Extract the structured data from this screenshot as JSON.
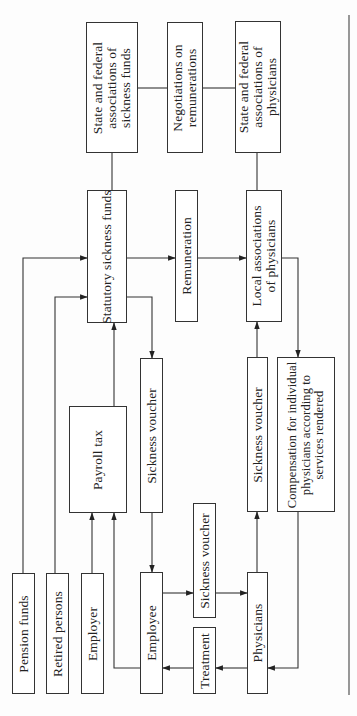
{
  "diagram": {
    "orientation": "rotated-90-ccw",
    "nodes": [
      {
        "id": "state_fed_sickness_funds",
        "label": "State and federal\nassociations of\nsickness funds",
        "rect": [
          86,
          22,
          138,
          153
        ]
      },
      {
        "id": "negotiations",
        "label": "Negotiations on\nremunerations",
        "rect": [
          167,
          22,
          203,
          153
        ]
      },
      {
        "id": "state_fed_physicians",
        "label": "State and federal\nassociations of\nphysicians",
        "rect": [
          235,
          21,
          281,
          153
        ]
      },
      {
        "id": "statutory_sickness_funds",
        "label": "Statutory sickness funds",
        "rect": [
          87,
          190,
          127,
          323
        ]
      },
      {
        "id": "remuneration",
        "label": "Remuneration",
        "rect": [
          175,
          190,
          198,
          322
        ]
      },
      {
        "id": "local_assoc_physicians",
        "label": "Local associations\nof physicians",
        "rect": [
          246,
          190,
          282,
          322
        ]
      },
      {
        "id": "payroll_tax",
        "label": "Payroll tax",
        "rect": [
          69,
          406,
          127,
          513
        ]
      },
      {
        "id": "sickness_voucher_1",
        "label": "Sickness voucher",
        "rect": [
          140,
          358,
          163,
          513
        ]
      },
      {
        "id": "sickness_voucher_3",
        "label": "Sickness voucher",
        "rect": [
          247,
          357,
          268,
          512
        ]
      },
      {
        "id": "compensation",
        "label": "Compensation for individual\nphysicians according to\nservices rendered",
        "rect": [
          277,
          357,
          335,
          512
        ]
      },
      {
        "id": "sickness_voucher_2",
        "label": "Sickness voucher",
        "rect": [
          193,
          503,
          216,
          618
        ]
      },
      {
        "id": "pension_funds",
        "label": "Pension funds",
        "rect": [
          12,
          573,
          35,
          694
        ]
      },
      {
        "id": "retired_persons",
        "label": "Retired persons",
        "rect": [
          46,
          573,
          69,
          694
        ]
      },
      {
        "id": "employer",
        "label": "Employer",
        "rect": [
          81,
          573,
          104,
          694
        ]
      },
      {
        "id": "employee",
        "label": "Employee",
        "rect": [
          140,
          572,
          163,
          694
        ]
      },
      {
        "id": "treatment",
        "label": "Treatment",
        "rect": [
          193,
          627,
          216,
          694
        ]
      },
      {
        "id": "physicians",
        "label": "Physicians",
        "rect": [
          247,
          572,
          268,
          694
        ]
      }
    ],
    "edges": [
      {
        "from": "state_fed_sickness_funds",
        "to": "statutory_sickness_funds",
        "arrow": false,
        "points": [
          [
            112,
            153
          ],
          [
            112,
            190
          ]
        ]
      },
      {
        "from": "state_fed_sickness_funds",
        "to": "negotiations",
        "arrow": false,
        "points": [
          [
            138,
            88
          ],
          [
            167,
            88
          ]
        ]
      },
      {
        "from": "negotiations",
        "to": "state_fed_physicians",
        "arrow": false,
        "points": [
          [
            203,
            88
          ],
          [
            235,
            88
          ]
        ]
      },
      {
        "from": "state_fed_physicians",
        "to": "local_assoc_physicians",
        "arrow": false,
        "points": [
          [
            257,
            153
          ],
          [
            257,
            190
          ]
        ]
      },
      {
        "from": "pension_funds",
        "to": "statutory_sickness_funds",
        "arrow": true,
        "points": [
          [
            23,
            573
          ],
          [
            23,
            258
          ],
          [
            87,
            258
          ]
        ]
      },
      {
        "from": "retired_persons",
        "to": "statutory_sickness_funds",
        "arrow": true,
        "points": [
          [
            55,
            573
          ],
          [
            55,
            297
          ],
          [
            87,
            297
          ]
        ]
      },
      {
        "from": "statutory_sickness_funds",
        "to": "remuneration",
        "arrow": true,
        "points": [
          [
            127,
            258
          ],
          [
            175,
            258
          ]
        ]
      },
      {
        "from": "remuneration",
        "to": "local_assoc_physicians",
        "arrow": true,
        "points": [
          [
            198,
            258
          ],
          [
            246,
            258
          ]
        ]
      },
      {
        "from": "statutory_sickness_funds",
        "to": "sickness_voucher_1",
        "arrow": true,
        "points": [
          [
            127,
            297
          ],
          [
            152,
            297
          ],
          [
            152,
            358
          ]
        ]
      },
      {
        "from": "payroll_tax",
        "to": "statutory_sickness_funds",
        "arrow": true,
        "points": [
          [
            114,
            406
          ],
          [
            114,
            323
          ]
        ]
      },
      {
        "from": "employer",
        "to": "payroll_tax",
        "arrow": true,
        "points": [
          [
            92,
            573
          ],
          [
            92,
            513
          ]
        ]
      },
      {
        "from": "employee",
        "to": "payroll_tax",
        "arrow": true,
        "points": [
          [
            140,
            668
          ],
          [
            114,
            668
          ],
          [
            114,
            513
          ]
        ]
      },
      {
        "from": "sickness_voucher_1",
        "to": "employee",
        "arrow": true,
        "points": [
          [
            152,
            513
          ],
          [
            152,
            572
          ]
        ]
      },
      {
        "from": "employee",
        "to": "sickness_voucher_2",
        "arrow": true,
        "points": [
          [
            163,
            593
          ],
          [
            193,
            593
          ]
        ]
      },
      {
        "from": "sickness_voucher_2",
        "to": "physicians",
        "arrow": true,
        "points": [
          [
            216,
            593
          ],
          [
            247,
            593
          ]
        ]
      },
      {
        "from": "physicians",
        "to": "sickness_voucher_3",
        "arrow": true,
        "points": [
          [
            257,
            572
          ],
          [
            257,
            512
          ]
        ]
      },
      {
        "from": "sickness_voucher_3",
        "to": "local_assoc_physicians",
        "arrow": true,
        "points": [
          [
            257,
            357
          ],
          [
            257,
            322
          ]
        ]
      },
      {
        "from": "local_assoc_physicians",
        "to": "compensation",
        "arrow": true,
        "points": [
          [
            282,
            258
          ],
          [
            298,
            258
          ],
          [
            298,
            357
          ]
        ]
      },
      {
        "from": "compensation",
        "to": "physicians",
        "arrow": true,
        "points": [
          [
            298,
            512
          ],
          [
            298,
            668
          ],
          [
            268,
            668
          ]
        ]
      },
      {
        "from": "physicians",
        "to": "treatment",
        "arrow": true,
        "points": [
          [
            247,
            668
          ],
          [
            216,
            668
          ]
        ]
      },
      {
        "from": "treatment",
        "to": "employee",
        "arrow": true,
        "points": [
          [
            193,
            668
          ],
          [
            163,
            668
          ]
        ]
      }
    ],
    "rule_line": {
      "x": 349,
      "y1": 15,
      "y2": 695
    },
    "colors": {
      "line": "#333333",
      "box_fill": "#ffffff",
      "background": "#fdfdfd"
    }
  }
}
